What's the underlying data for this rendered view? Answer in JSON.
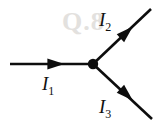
{
  "figure": {
    "background_color": "#ffffff",
    "line_color": "#0d0d0d",
    "label_color": "#111111",
    "watermark": {
      "text": "Q.8",
      "color": "#e3e1de"
    },
    "junction": {
      "name": "junction-node",
      "x": 93,
      "y": 64,
      "radius": 5.2
    },
    "branches": [
      {
        "id": "I1",
        "label_symbol": "I",
        "label_subscript": "1",
        "direction": "into-junction",
        "orientation": "horizontal-left",
        "x1": 10,
        "y1": 64,
        "x2": 93,
        "y2": 64,
        "arrow_x": 55,
        "arrow_y": 64,
        "arrow_angle": 0,
        "label_x": 42,
        "label_y": 90
      },
      {
        "id": "I2",
        "label_symbol": "I",
        "label_subscript": "2",
        "direction": "out-of-junction",
        "orientation": "upper-right",
        "x1": 93,
        "y1": 64,
        "x2": 151,
        "y2": 9,
        "arrow_x": 126,
        "arrow_y": 33,
        "arrow_angle": -43,
        "label_x": 99,
        "label_y": 26
      },
      {
        "id": "I3",
        "label_symbol": "I",
        "label_subscript": "3",
        "direction": "out-of-junction",
        "orientation": "lower-right",
        "x1": 93,
        "y1": 64,
        "x2": 152,
        "y2": 119,
        "arrow_x": 126,
        "arrow_y": 94,
        "arrow_angle": 43,
        "label_x": 99,
        "label_y": 113
      }
    ]
  }
}
